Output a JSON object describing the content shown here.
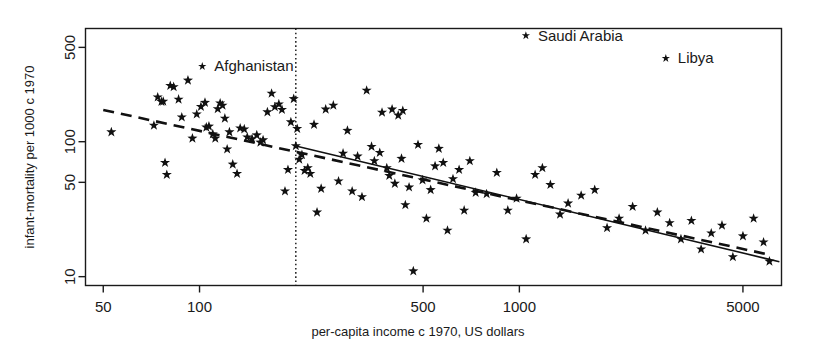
{
  "chart_data": {
    "type": "scatter",
    "title": "",
    "subtitle": "",
    "xlabel": "per-capita income c 1970, US dollars",
    "ylabel": "infant-mortality per 1000 c 1970",
    "xscale": "log",
    "yscale": "log",
    "xlim": [
      44,
      6600
    ],
    "ylim": [
      8.6,
      690
    ],
    "grid": false,
    "legend": "none",
    "xticks": [
      50,
      100,
      500,
      1000,
      5000
    ],
    "xtick_labels": [
      "50",
      "100",
      "500",
      "1000",
      "5000"
    ],
    "yticks": [
      10,
      50,
      100,
      500
    ],
    "ytick_labels": [
      "10",
      "50",
      "100",
      "500"
    ],
    "marker": "star",
    "marker_color": "#111111",
    "annotations": [
      {
        "label": "Afghanistan",
        "marker_x": 102,
        "marker_y": 362
      },
      {
        "label": "Saudi Arabia",
        "marker_x": 1048,
        "marker_y": 612
      },
      {
        "label": "Libya",
        "marker_x": 2870,
        "marker_y": 415
      }
    ],
    "reference_lines": [
      {
        "name": "income-threshold",
        "orientation": "vertical",
        "style": "dotted",
        "x": 200
      },
      {
        "name": "robust-fit-dashed",
        "style": "dashed",
        "x_start": 50,
        "y_start": 172,
        "x_end": 6000,
        "y_end": 14.6
      },
      {
        "name": "ols-fit-solid",
        "style": "solid",
        "x_start": 200,
        "y_start": 93,
        "x_end": 6500,
        "y_end": 12.9
      }
    ],
    "series": [
      {
        "name": "countries",
        "points": [
          [
            53,
            118
          ],
          [
            72,
            132
          ],
          [
            74,
            214
          ],
          [
            76,
            198
          ],
          [
            77,
            199
          ],
          [
            78,
            70
          ],
          [
            79,
            57
          ],
          [
            81,
            260
          ],
          [
            83,
            255
          ],
          [
            86,
            206
          ],
          [
            88,
            152
          ],
          [
            92,
            285
          ],
          [
            95,
            106
          ],
          [
            98,
            160
          ],
          [
            101,
            182
          ],
          [
            104,
            195
          ],
          [
            105,
            128
          ],
          [
            107,
            130
          ],
          [
            110,
            114
          ],
          [
            112,
            106
          ],
          [
            114,
            175
          ],
          [
            116,
            193
          ],
          [
            118,
            186
          ],
          [
            120,
            149
          ],
          [
            122,
            88
          ],
          [
            124,
            118
          ],
          [
            127,
            68
          ],
          [
            131,
            58
          ],
          [
            134,
            126
          ],
          [
            138,
            124
          ],
          [
            141,
            108
          ],
          [
            146,
            105
          ],
          [
            151,
            112
          ],
          [
            155,
            99
          ],
          [
            158,
            103
          ],
          [
            163,
            166
          ],
          [
            168,
            228
          ],
          [
            172,
            181
          ],
          [
            177,
            190
          ],
          [
            181,
            173
          ],
          [
            185,
            43
          ],
          [
            189,
            62
          ],
          [
            193,
            140
          ],
          [
            197,
            208
          ],
          [
            200,
            93
          ],
          [
            202,
            125
          ],
          [
            205,
            74
          ],
          [
            209,
            80
          ],
          [
            213,
            61
          ],
          [
            218,
            64
          ],
          [
            222,
            58
          ],
          [
            228,
            134
          ],
          [
            233,
            30
          ],
          [
            240,
            45
          ],
          [
            248,
            174
          ],
          [
            262,
            186
          ],
          [
            272,
            51
          ],
          [
            281,
            82
          ],
          [
            290,
            121
          ],
          [
            300,
            43
          ],
          [
            312,
            78
          ],
          [
            322,
            39
          ],
          [
            333,
            240
          ],
          [
            345,
            92
          ],
          [
            352,
            72
          ],
          [
            366,
            83
          ],
          [
            372,
            165
          ],
          [
            385,
            64
          ],
          [
            392,
            56
          ],
          [
            400,
            174
          ],
          [
            408,
            49
          ],
          [
            418,
            157
          ],
          [
            428,
            75
          ],
          [
            432,
            170
          ],
          [
            440,
            34
          ],
          [
            452,
            46
          ],
          [
            466,
            11
          ],
          [
            482,
            95
          ],
          [
            498,
            52
          ],
          [
            512,
            27
          ],
          [
            528,
            44
          ],
          [
            545,
            66
          ],
          [
            560,
            89
          ],
          [
            578,
            70
          ],
          [
            596,
            22
          ],
          [
            620,
            53
          ],
          [
            648,
            62
          ],
          [
            672,
            31
          ],
          [
            700,
            72
          ],
          [
            730,
            42
          ],
          [
            790,
            41
          ],
          [
            850,
            59
          ],
          [
            920,
            31
          ],
          [
            980,
            38
          ],
          [
            1050,
            19
          ],
          [
            1120,
            57
          ],
          [
            1180,
            64
          ],
          [
            1250,
            48
          ],
          [
            1340,
            29
          ],
          [
            1420,
            35
          ],
          [
            1560,
            40
          ],
          [
            1720,
            44
          ],
          [
            1880,
            23
          ],
          [
            2050,
            27
          ],
          [
            2260,
            33
          ],
          [
            2480,
            22
          ],
          [
            2700,
            30
          ],
          [
            2950,
            25
          ],
          [
            3200,
            19
          ],
          [
            3450,
            26
          ],
          [
            3700,
            16
          ],
          [
            3980,
            21
          ],
          [
            4300,
            24
          ],
          [
            4650,
            14
          ],
          [
            5000,
            20
          ],
          [
            5400,
            27
          ],
          [
            5800,
            18
          ],
          [
            6050,
            13
          ]
        ]
      }
    ]
  }
}
